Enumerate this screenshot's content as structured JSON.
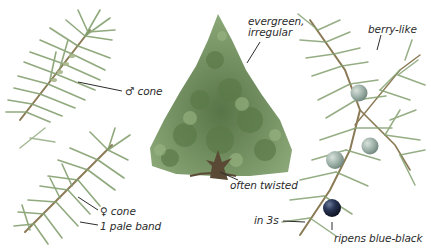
{
  "plate": {
    "subject": "juniper identification illustration",
    "colors": {
      "background": "#ffffff",
      "needle": "#7f9a6a",
      "needle_dark": "#5d7a4c",
      "stem": "#8a7a55",
      "tree_foliage": "#6f8f5a",
      "tree_foliage_dark": "#4d6b3c",
      "trunk": "#5a4a35",
      "berry_unripe": "#8fa6a0",
      "berry_ripe": "#1f2a44",
      "label_text": "#2b2b2b",
      "leader_line": "#2b2b2b"
    }
  },
  "labels": {
    "male_cone": "♂ cone",
    "female_cone": "♀ cone",
    "pale_band": "1 pale band",
    "habit": "evergreen,\nirregular",
    "trunk": "often twisted",
    "fruit": "berry-like",
    "whorl": "in 3s",
    "ripe_fruit": "ripens blue-black"
  }
}
